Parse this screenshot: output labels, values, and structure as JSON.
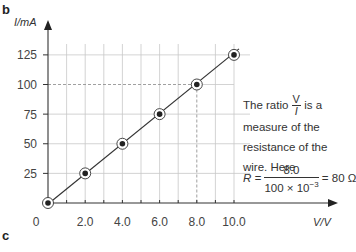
{
  "panel_labels": {
    "top": "b",
    "bottom": "c"
  },
  "chart_data": {
    "type": "line",
    "title": "",
    "xlabel": "V/V",
    "ylabel": "I/mA",
    "x": [
      0,
      2.0,
      4.0,
      6.0,
      8.0,
      10.0
    ],
    "series": [
      {
        "name": "I vs V",
        "values": [
          0,
          25,
          50,
          75,
          100,
          125
        ],
        "marker": "circled-dot",
        "color": "#333333"
      }
    ],
    "x_ticks": [
      "0",
      "2.0",
      "4.0",
      "6.0",
      "8.0",
      "10.0"
    ],
    "y_ticks": [
      "25",
      "50",
      "75",
      "100",
      "125"
    ],
    "xlim": [
      0,
      10.0
    ],
    "ylim": [
      0,
      125
    ],
    "grid": true,
    "highlight": {
      "x": 8.0,
      "y": 100,
      "style": "dashed"
    }
  },
  "annotation": {
    "line1_pre": "The ratio",
    "frac_num": "V",
    "frac_den": "I",
    "line1_post": "is a",
    "line2": "measure of the",
    "line3": "resistance of the",
    "line4": "wire. Here",
    "eq_lhs": "R =",
    "eq_num": "8.0",
    "eq_den_base": "100 × 10",
    "eq_den_exp": "−3",
    "eq_rhs": "= 80 Ω"
  }
}
